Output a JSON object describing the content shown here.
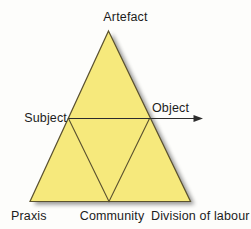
{
  "diagram": {
    "fill_color": "#f6e97c",
    "stroke_color": "#5b5230",
    "background_color": "#fdfdfb",
    "shadow_color": "#cfcdc6",
    "text_color": "#1c1c1c",
    "nodes": {
      "artefact": "Artefact",
      "subject": "Subject",
      "object": "Object",
      "praxis": "Praxis",
      "community": "Community",
      "division": "Division of labour"
    },
    "arrow": {
      "name": "subject-to-object-arrow",
      "direction": "right"
    }
  }
}
